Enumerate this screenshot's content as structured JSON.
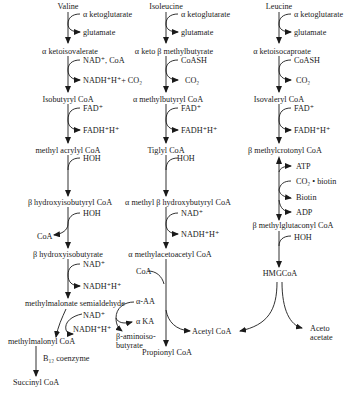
{
  "pathways": [
    {
      "name": "valine",
      "start": "Valine",
      "steps": [
        {
          "in": "α ketoglutarate",
          "out": "glutamate",
          "product": "α ketoisovalerate"
        },
        {
          "in": "NAD⁺, CoA",
          "out": "NADH⁺H⁺+ CO₂",
          "product": "Isobutyryl CoA"
        },
        {
          "in": "FAD⁺",
          "out": "FADH⁺H⁺",
          "product": "methyl acrylyl CoA"
        },
        {
          "in": "HOH",
          "out": "",
          "product": "β hydroxyisobutyryl CoA"
        },
        {
          "in": "HOH",
          "out": "CoA",
          "product": "β hydroxyisobutyrate"
        },
        {
          "in": "NAD⁺",
          "out": "NADH⁺H⁺",
          "product": "methylmalonate semialdehyde"
        }
      ],
      "branch_left": {
        "in": "NAD⁺",
        "out": "NADH⁺H⁺",
        "product": "methylmalonyl CoA"
      },
      "branch_right": {
        "in": "α-AA",
        "out": "α KA",
        "product": "β-aminoiso-\nbutyrate",
        "product_line1": "β-aminoiso-",
        "product_line2": "butyrate"
      },
      "final": {
        "cofactor": "B₁₂ coenzyme",
        "product": "Succinyl CoA"
      }
    },
    {
      "name": "isoleucine",
      "start": "Isoleucine",
      "steps": [
        {
          "in": "α ketoglutarate",
          "out": "glutamate",
          "product": "α keto β methylbutyrate"
        },
        {
          "in": "CoASH",
          "out": "CO₂",
          "product": "α methylbutyryl CoA"
        },
        {
          "in": "FAD⁺",
          "out": "FADH⁺H⁺",
          "product": "Tiglyl CoA"
        },
        {
          "in": "HOH",
          "out": "",
          "product": "α methyl β hydroxybutyryl CoA"
        },
        {
          "in": "NAD⁺",
          "out": "NADH⁺H⁺",
          "product": "α methylacetoacetyl CoA"
        }
      ],
      "thiolase": {
        "in": "CoA",
        "product_down": "Propionyl CoA",
        "product_side": "Acetyl CoA"
      }
    },
    {
      "name": "leucine",
      "start": "Leucine",
      "steps": [
        {
          "in": "α ketoglutarate",
          "out": "glutamate",
          "product": "α ketoisocaproate"
        },
        {
          "in": "CoASH",
          "out": "CO₂",
          "product": "Isovaleryl CoA"
        },
        {
          "in": "FAD⁺",
          "out": "FADH⁺H⁺",
          "product": "β methylcrotonyl CoA"
        },
        {
          "cofactors": [
            "ATP",
            "CO₂ • biotin",
            "Biotin",
            "ADP"
          ],
          "product": "β methylglutaconyl CoA"
        },
        {
          "in": "HOH",
          "out": "",
          "product": "HMGCoA"
        }
      ],
      "split": {
        "left": "Acetyl CoA",
        "right_line1": "Aceto",
        "right_line2": "acetate"
      }
    }
  ]
}
